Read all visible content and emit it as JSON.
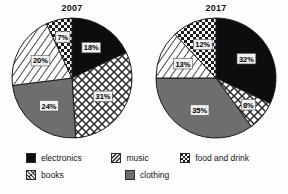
{
  "figure": {
    "background": "#fdfdfd"
  },
  "legend": {
    "items": [
      {
        "label": "electronics",
        "key": "electronics",
        "pattern": "solid-black",
        "color": "#0d0d0d"
      },
      {
        "label": "music",
        "key": "music",
        "pattern": "diagonal-lines",
        "color": "#ffffff"
      },
      {
        "label": "food and drink",
        "key": "food_and_drink",
        "pattern": "checker-dots",
        "color": "#ffffff"
      },
      {
        "label": "books",
        "key": "books",
        "pattern": "diamond-crosshatch",
        "color": "#ffffff"
      },
      {
        "label": "clothing",
        "key": "clothing",
        "pattern": "solid-gray",
        "color": "#6e6e6e"
      }
    ],
    "row1": [
      "electronics",
      "music",
      "food and drink"
    ],
    "row2": [
      "books",
      "clothing"
    ]
  },
  "chart_data": [
    {
      "type": "pie",
      "title": "2007",
      "categories": [
        "electronics",
        "books",
        "clothing",
        "music",
        "food and drink"
      ],
      "values": [
        18,
        31,
        24,
        20,
        7
      ],
      "labels": [
        "18%",
        "31%",
        "24%",
        "20%",
        "7%"
      ],
      "patterns": [
        "solid-black",
        "diamond-crosshatch",
        "solid-gray",
        "diagonal-lines",
        "checker-dots"
      ],
      "start_angle_deg": 0,
      "direction": "clockwise",
      "xlabel": "",
      "ylabel": "",
      "legend_position": "bottom"
    },
    {
      "type": "pie",
      "title": "2017",
      "categories": [
        "electronics",
        "books",
        "clothing",
        "music",
        "food and drink"
      ],
      "values": [
        32,
        8,
        35,
        13,
        12
      ],
      "labels": [
        "32%",
        "8%",
        "35%",
        "13%",
        "12%"
      ],
      "patterns": [
        "solid-black",
        "diamond-crosshatch",
        "solid-gray",
        "diagonal-lines",
        "checker-dots"
      ],
      "start_angle_deg": 0,
      "direction": "clockwise",
      "xlabel": "",
      "ylabel": "",
      "legend_position": "bottom"
    }
  ]
}
